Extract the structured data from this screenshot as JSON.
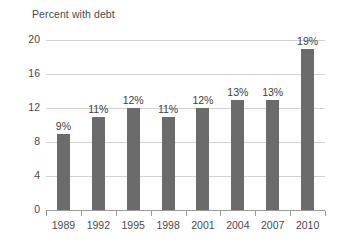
{
  "chart_data": {
    "type": "bar",
    "title": "Percent with debt",
    "xlabel": "",
    "ylabel": "",
    "categories": [
      "1989",
      "1992",
      "1995",
      "1998",
      "2001",
      "2004",
      "2007",
      "2010"
    ],
    "values": [
      9,
      11,
      12,
      11,
      12,
      13,
      13,
      19
    ],
    "data_labels": [
      "9%",
      "11%",
      "12%",
      "11%",
      "12%",
      "13%",
      "13%",
      "19%"
    ],
    "ylim": [
      0,
      20
    ],
    "yticks": [
      0,
      4,
      8,
      12,
      16,
      20
    ],
    "ytick_labels": [
      "0",
      "4",
      "8",
      "12",
      "16",
      "20"
    ],
    "grid": true,
    "legend": "none",
    "series": [
      {
        "name": "Percent with debt",
        "values": [
          9,
          11,
          12,
          11,
          12,
          13,
          13,
          19
        ]
      }
    ],
    "colors": {
      "bar": "#6b6b6b",
      "gridline": "#d2d2d2",
      "axis": "#9a9a9a",
      "text": "#4a4a4a",
      "background": "#ffffff"
    }
  }
}
